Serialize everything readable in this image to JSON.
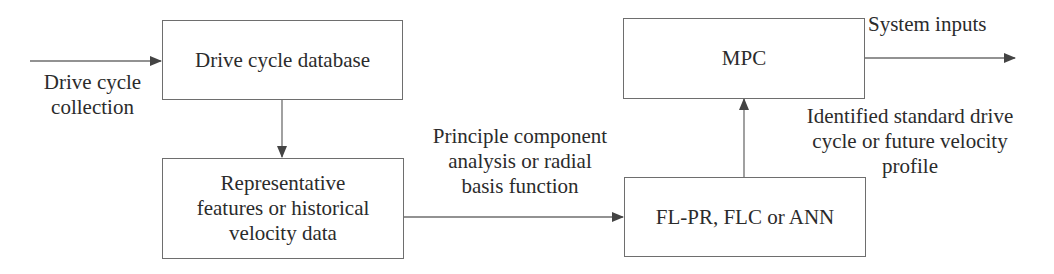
{
  "diagram": {
    "nodes": {
      "database": {
        "label": "Drive cycle database"
      },
      "features": {
        "label": "Representative\nfeatures or historical\nvelocity data"
      },
      "mpc": {
        "label": "MPC"
      },
      "predictor": {
        "label": "FL-PR, FLC or ANN"
      }
    },
    "edge_labels": {
      "input": "Drive cycle\ncollection",
      "features_to_predictor": "Principle component\nanalysis or radial\nbasis function",
      "predictor_to_mpc": "Identified standard drive\ncycle or future velocity\nprofile",
      "output": "System inputs"
    },
    "colors": {
      "line": "#6e6e6e",
      "arrowhead": "#444444",
      "text": "#2b2b2b"
    }
  }
}
